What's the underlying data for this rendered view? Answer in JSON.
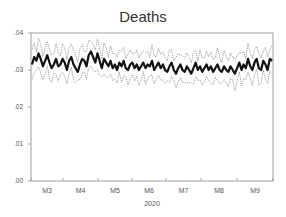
{
  "chart_data": {
    "type": "line",
    "title": "Deaths",
    "xlabel": "2020",
    "ylabel": "",
    "ylim": [
      0.0,
      0.04
    ],
    "yticks": [
      ".00",
      ".01",
      ".02",
      ".03",
      ".04"
    ],
    "xticks": [
      "M3",
      "M4",
      "M5",
      "M6",
      "M7",
      "M8",
      "M9"
    ],
    "grid": false,
    "legend": "none",
    "series": [
      {
        "name": "Deaths (forecast)",
        "style": "thick solid black",
        "values": [
          0.0315,
          0.0335,
          0.0325,
          0.0345,
          0.033,
          0.031,
          0.0325,
          0.034,
          0.032,
          0.0305,
          0.0315,
          0.033,
          0.031,
          0.0315,
          0.033,
          0.032,
          0.03,
          0.0325,
          0.0335,
          0.0315,
          0.0305,
          0.0295,
          0.0315,
          0.033,
          0.0325,
          0.031,
          0.034,
          0.035,
          0.0335,
          0.032,
          0.0345,
          0.0325,
          0.0305,
          0.033,
          0.032,
          0.031,
          0.0325,
          0.0305,
          0.0315,
          0.03,
          0.032,
          0.031,
          0.0325,
          0.0305,
          0.03,
          0.0315,
          0.032,
          0.0305,
          0.0315,
          0.03,
          0.031,
          0.032,
          0.0305,
          0.0315,
          0.031,
          0.0325,
          0.03,
          0.031,
          0.032,
          0.0305,
          0.0315,
          0.03,
          0.0295,
          0.031,
          0.032,
          0.03,
          0.029,
          0.0305,
          0.0315,
          0.03,
          0.0295,
          0.031,
          0.03,
          0.029,
          0.0305,
          0.032,
          0.03,
          0.031,
          0.0295,
          0.0305,
          0.0315,
          0.03,
          0.031,
          0.0295,
          0.0305,
          0.0315,
          0.03,
          0.0295,
          0.031,
          0.03,
          0.0295,
          0.031,
          0.03,
          0.029,
          0.0305,
          0.032,
          0.03,
          0.0315,
          0.0305,
          0.033,
          0.031,
          0.03,
          0.032,
          0.033,
          0.0305,
          0.03,
          0.0325,
          0.0315,
          0.03,
          0.033,
          0.0325
        ]
      },
      {
        "name": "Upper band",
        "style": "dotted",
        "offset": 0.0035
      },
      {
        "name": "Lower band",
        "style": "dotted",
        "offset": -0.0035
      }
    ],
    "x_range": [
      "2020-03",
      "2020-09"
    ]
  }
}
